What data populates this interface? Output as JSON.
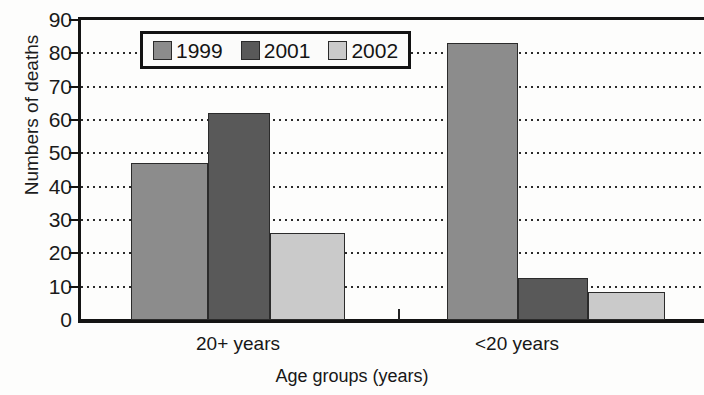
{
  "chart_data": {
    "type": "bar",
    "title": "",
    "xlabel": "Age groups (years)",
    "ylabel": "Numbers of deaths",
    "categories": [
      "20+ years",
      "<20 years"
    ],
    "series": [
      {
        "name": "1999",
        "color": "#8c8c8c",
        "values": [
          47,
          83
        ]
      },
      {
        "name": "2001",
        "color": "#595959",
        "values": [
          62,
          12.5
        ]
      },
      {
        "name": "2002",
        "color": "#cacaca",
        "values": [
          26,
          8.5
        ]
      }
    ],
    "ylim": [
      0,
      90
    ],
    "yticks": [
      0,
      10,
      20,
      30,
      40,
      50,
      60,
      70,
      80,
      90
    ],
    "ytick_labels": [
      "0",
      "10",
      "20",
      "30",
      "40",
      "50",
      "60",
      "70",
      "80",
      "90"
    ],
    "grid": "horizontal-dotted",
    "legend_position": "top-center",
    "bar_border_color": "#2b2b2b",
    "axis_color": "#141414"
  },
  "legend": {
    "entries": [
      {
        "label": "1999",
        "color": "#8c8c8c"
      },
      {
        "label": "2001",
        "color": "#595959"
      },
      {
        "label": "2002",
        "color": "#cacaca"
      }
    ]
  },
  "axes": {
    "y_title": "Numbers of deaths",
    "x_title": "Age groups (years)"
  }
}
